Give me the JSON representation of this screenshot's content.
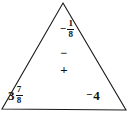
{
  "diagram": {
    "type": "triangle-number-puzzle",
    "shape_name": "triangle",
    "stroke_color": "#1a1a1a",
    "fill_color": "#ffffff",
    "background_color": "#ffffff",
    "text_color": "#111111",
    "vertices": {
      "apex": "63,3",
      "bottom_left": "2,109",
      "bottom_right": "126,110"
    }
  },
  "values": {
    "top": {
      "label": "-1/8",
      "sign": "−",
      "whole": "",
      "numerator": "1",
      "denominator": "8"
    },
    "bottom_left": {
      "label": "3 7/8",
      "sign": "",
      "whole": "3",
      "numerator": "7",
      "denominator": "8"
    },
    "bottom_right": {
      "label": "-4",
      "sign": "−",
      "integer": "4"
    }
  },
  "center_operators": {
    "minus": "−",
    "plus": "+"
  }
}
